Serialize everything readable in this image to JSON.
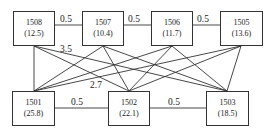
{
  "diagram": {
    "top_nodes": [
      {
        "id": "1508",
        "value": "(12.5)"
      },
      {
        "id": "1507",
        "value": "(10.4)"
      },
      {
        "id": "1506",
        "value": "(11.7)"
      },
      {
        "id": "1505",
        "value": "(13.6)"
      }
    ],
    "bottom_nodes": [
      {
        "id": "1501",
        "value": "(25.8)"
      },
      {
        "id": "1502",
        "value": "(22.1)"
      },
      {
        "id": "1503",
        "value": "(18.5)"
      }
    ],
    "top_edges": [
      {
        "from": "1508",
        "to": "1507",
        "label": "0.5"
      },
      {
        "from": "1507",
        "to": "1506",
        "label": "0.5"
      },
      {
        "from": "1506",
        "to": "1505",
        "label": "0.5"
      }
    ],
    "bottom_edges": [
      {
        "from": "1501",
        "to": "1502",
        "label": "0.5"
      },
      {
        "from": "1502",
        "to": "1503",
        "label": "0.5"
      }
    ],
    "cross_edge_labels": [
      {
        "label": "3.5"
      },
      {
        "label": "2.7"
      }
    ],
    "note": "Every top node connects to every bottom node"
  }
}
